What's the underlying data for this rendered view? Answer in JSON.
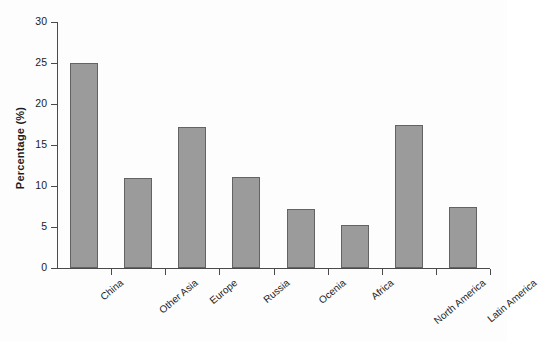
{
  "chart_data": {
    "type": "bar",
    "title": "",
    "subtitle": "",
    "xlabel": "",
    "ylabel": "Percentage (%)",
    "ylim": [
      0,
      30
    ],
    "yticks": [
      0,
      5,
      10,
      15,
      20,
      25,
      30
    ],
    "ytick_labels": [
      "0",
      "5",
      "10",
      "15",
      "20",
      "25",
      "30"
    ],
    "grid": false,
    "legend": null,
    "bar_color": "#9b9b9b",
    "bar_edge_color": "#636363",
    "categories": [
      "China",
      "Other Asia",
      "Europe",
      "Russia",
      "Ocenia",
      "Africa",
      "North America",
      "Latin America"
    ],
    "values": [
      25.0,
      11.0,
      17.2,
      11.1,
      7.2,
      5.3,
      17.5,
      7.4
    ]
  }
}
